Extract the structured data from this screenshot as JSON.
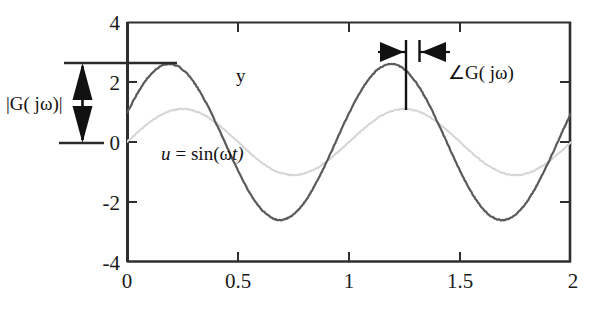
{
  "figure": {
    "title": "",
    "background": "#ffffff",
    "axis_color": "#333333",
    "width": 599,
    "height": 315
  },
  "axes": {
    "x": {
      "min": 0,
      "max": 2,
      "ticks": [
        0,
        0.5,
        1,
        1.5,
        2
      ],
      "tick_labels": [
        "0",
        "0.5",
        "1",
        "1.5",
        "2"
      ],
      "label": ""
    },
    "y": {
      "min": -4,
      "max": 4,
      "ticks": [
        -4,
        -2,
        0,
        2,
        4
      ],
      "tick_labels": [
        "-4",
        "-2",
        "0",
        "2",
        "4"
      ],
      "label": ""
    }
  },
  "labels": {
    "output_curve": "y",
    "input_curve_lhs": "u",
    "input_curve_eq": "= sin(",
    "input_curve_omega": "ω",
    "input_curve_t": "t)",
    "magnitude": "|G( jω)|",
    "phase_angle_symbol": "∠",
    "phase_angle": "G( jω)"
  },
  "annotations": {
    "magnitude_arrow": {
      "name": "magnitude-double-arrow",
      "from_value": 0,
      "to_value": 2.6,
      "guide_line_top_value": 2.6,
      "guide_line_bottom_value": 0
    },
    "phase_arrow": {
      "name": "phase-double-arrow",
      "from_time": 1.255,
      "to_time": 1.315,
      "at_value": 3.05
    }
  },
  "chart_data": {
    "type": "line",
    "title": "",
    "xlabel": "",
    "ylabel": "",
    "xlim": [
      0,
      2
    ],
    "ylim": [
      -4,
      4
    ],
    "grid": false,
    "legend": "inline-annotations",
    "series": [
      {
        "name": "u = sin(ωt)",
        "color": "#d5d5d5",
        "amplitude": 1.1,
        "period": 1.0,
        "phase_shift": 0.0,
        "linewidth": 2.0,
        "description": "input sinusoid, light gray"
      },
      {
        "name": "y",
        "color": "#5a5a5a",
        "amplitude": 2.6,
        "period": 1.0,
        "phase_shift": 0.06,
        "linewidth": 2.2,
        "description": "output sinusoid, amplified and phase-advanced, dark gray"
      }
    ],
    "notes": [
      "|G(jω)| is the peak amplitude of y ≈ 2.6",
      "∠G(jω) is the time shift between the peaks of u and y"
    ]
  }
}
